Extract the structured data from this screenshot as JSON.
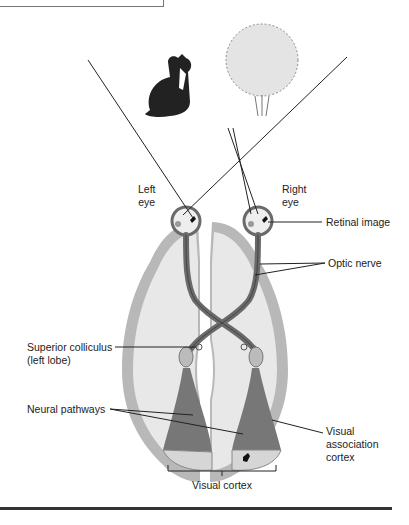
{
  "figure": {
    "labels": {
      "left_eye": [
        "Left",
        "eye"
      ],
      "right_eye": [
        "Right",
        "eye"
      ],
      "retinal_image": "Retinal image",
      "optic_nerve": "Optic nerve",
      "superior_colliculus": [
        "Superior colliculus",
        "(left lobe)"
      ],
      "neural_pathways": "Neural pathways",
      "visual_association_cortex": [
        "Visual",
        "association",
        "cortex"
      ],
      "visual_cortex": "Visual cortex"
    },
    "objects": [
      "cat",
      "bush"
    ],
    "colors": {
      "cortex_gray": "#b8b8b8",
      "brain_fill": "#e6e6e6",
      "nerve_dark": "#6a6a6a",
      "line": "#222222"
    }
  }
}
